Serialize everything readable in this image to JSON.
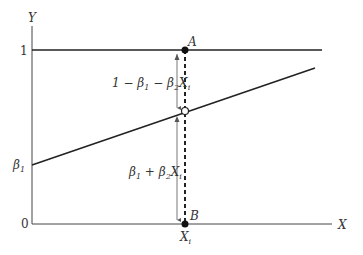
{
  "diagram": {
    "type": "linear-probability-model",
    "axes": {
      "y_label": "Y",
      "x_label": "X",
      "y_ticks": [
        "1",
        "β",
        "0"
      ],
      "y_tick_beta_sub": "1"
    },
    "points": {
      "A": "A",
      "B": "B",
      "x_marker": "X",
      "x_marker_sub": "i"
    },
    "annotations": {
      "upper": {
        "part1": "1 − β",
        "sub1": "1",
        "part2": " − β",
        "sub2": "2",
        "part3": "X",
        "sub3": "i"
      },
      "lower": {
        "part1": "β",
        "sub1": "1",
        "part2": " + β",
        "sub2": "2",
        "part3": "X",
        "sub3": "i"
      }
    },
    "colors": {
      "line": "#222222",
      "arrow": "#555555",
      "text": "#333333"
    }
  }
}
